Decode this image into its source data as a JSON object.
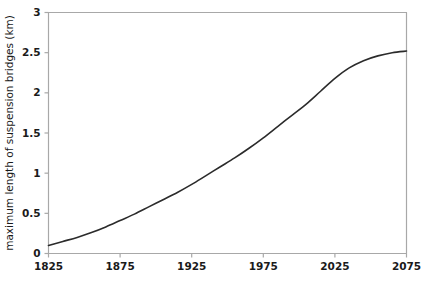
{
  "chart_data": {
    "type": "line",
    "title": "",
    "xlabel": "",
    "ylabel": "maximum length of suspension bridges (km)",
    "xlim": [
      1825,
      2075
    ],
    "ylim": [
      0,
      3
    ],
    "xticks": [
      1825,
      1875,
      1925,
      1975,
      2025,
      2075
    ],
    "yticks": [
      0,
      0.5,
      1,
      1.5,
      2,
      2.5,
      3
    ],
    "xtick_labels": [
      "1825",
      "1875",
      "1925",
      "1975",
      "2025",
      "2075"
    ],
    "ytick_labels": [
      "0",
      "0.5",
      "1",
      "1.5",
      "2",
      "2.5",
      "3"
    ],
    "grid": false,
    "legend": false,
    "series": [
      {
        "name": "maximum length of suspension bridges",
        "x": [
          1825,
          1835,
          1845,
          1855,
          1865,
          1875,
          1885,
          1895,
          1905,
          1915,
          1925,
          1935,
          1945,
          1955,
          1965,
          1975,
          1985,
          1995,
          2005,
          2015,
          2025,
          2035,
          2045,
          2055,
          2065,
          2075
        ],
        "values": [
          0.1,
          0.15,
          0.2,
          0.26,
          0.33,
          0.41,
          0.49,
          0.58,
          0.67,
          0.76,
          0.86,
          0.97,
          1.08,
          1.19,
          1.31,
          1.44,
          1.58,
          1.72,
          1.86,
          2.02,
          2.18,
          2.31,
          2.4,
          2.46,
          2.5,
          2.52
        ]
      }
    ],
    "colors": {
      "curve": "#2b2b2b",
      "axis": "#a8a8a8",
      "text": "#1a1a1a",
      "background": "#ffffff"
    }
  },
  "axes": {
    "y_axis_title": "maximum length of suspension bridges (km)"
  }
}
